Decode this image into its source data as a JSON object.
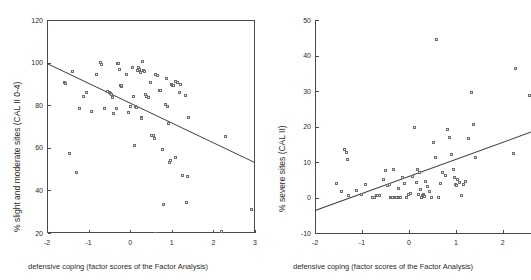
{
  "figure": {
    "panels": [
      "left",
      "right"
    ],
    "marker_color": "#6e6e6e",
    "line_color": "#3a3a3a",
    "axis_color": "#4a4a4a"
  },
  "left": {
    "y_title": "% slight and moderate sites (CAL II 0-4)",
    "x_title": "defensive coping (factor scores of the Factor Analysis)",
    "y_ticks": [
      "20",
      "40",
      "60",
      "80",
      "100",
      "120"
    ],
    "x_ticks": [
      "-2",
      "-1",
      "0",
      "1",
      "2",
      "3"
    ]
  },
  "right": {
    "y_title": "% severe sites (CAL II)",
    "x_title": "defensive coping (factor scores of the Factor Analysis)",
    "y_ticks": [
      "-10",
      "0",
      "10",
      "20",
      "30",
      "40",
      "50"
    ],
    "x_ticks": [
      "-2",
      "-1",
      "0",
      "1",
      "2"
    ]
  },
  "chart_data": [
    {
      "type": "scatter",
      "panel": "left",
      "title": "",
      "xlabel": "defensive coping (factor scores of the Factor Analysis)",
      "ylabel": "% slight and moderate sites (CAL II 0-4)",
      "xlim": [
        -2,
        3
      ],
      "ylim": [
        20,
        120
      ],
      "xticks": [
        -2,
        -1,
        0,
        1,
        2,
        3
      ],
      "yticks": [
        20,
        40,
        60,
        80,
        100,
        120
      ],
      "grid": false,
      "legend": "none",
      "frame": "box",
      "regression_line": {
        "x": [
          -2,
          3
        ],
        "y": [
          100.0,
          53.5
        ]
      },
      "points": [
        [
          -1.58,
          90.8
        ],
        [
          -1.55,
          90.2
        ],
        [
          -1.47,
          57.2
        ],
        [
          -1.38,
          95.8
        ],
        [
          -1.3,
          48.6
        ],
        [
          -1.22,
          78.6
        ],
        [
          -1.12,
          84.3
        ],
        [
          -1.05,
          86.0
        ],
        [
          -0.92,
          77.0
        ],
        [
          -0.8,
          94.6
        ],
        [
          -0.72,
          100.2
        ],
        [
          -0.7,
          99.2
        ],
        [
          -0.62,
          78.3
        ],
        [
          -0.55,
          86.6
        ],
        [
          -0.5,
          85.8
        ],
        [
          -0.47,
          85.4
        ],
        [
          -0.44,
          85.0
        ],
        [
          -0.42,
          83.8
        ],
        [
          -0.4,
          76.0
        ],
        [
          -0.33,
          78.5
        ],
        [
          -0.3,
          99.8
        ],
        [
          -0.28,
          99.6
        ],
        [
          -0.26,
          96.8
        ],
        [
          -0.24,
          89.4
        ],
        [
          -0.22,
          88.9
        ],
        [
          -0.2,
          89.2
        ],
        [
          -0.1,
          94.6
        ],
        [
          -0.05,
          76.5
        ],
        [
          0.0,
          79.2
        ],
        [
          0.05,
          97.8
        ],
        [
          0.08,
          84.0
        ],
        [
          0.1,
          61.2
        ],
        [
          0.12,
          79.3
        ],
        [
          0.15,
          79.0
        ],
        [
          0.18,
          96.2
        ],
        [
          0.2,
          97.5
        ],
        [
          0.22,
          96.6
        ],
        [
          0.24,
          95.2
        ],
        [
          0.26,
          74.0
        ],
        [
          0.28,
          73.8
        ],
        [
          0.3,
          100.5
        ],
        [
          0.32,
          96.4
        ],
        [
          0.34,
          96.0
        ],
        [
          0.36,
          85.2
        ],
        [
          0.4,
          84.0
        ],
        [
          0.44,
          83.8
        ],
        [
          0.48,
          90.8
        ],
        [
          0.52,
          66.0
        ],
        [
          0.55,
          65.6
        ],
        [
          0.58,
          64.2
        ],
        [
          0.6,
          19.8
        ],
        [
          0.62,
          94.2
        ],
        [
          0.66,
          93.8
        ],
        [
          0.7,
          87.0
        ],
        [
          0.74,
          86.8
        ],
        [
          0.78,
          59.2
        ],
        [
          0.8,
          33.4
        ],
        [
          0.84,
          80.2
        ],
        [
          0.88,
          92.4
        ],
        [
          0.9,
          79.4
        ],
        [
          0.92,
          71.2
        ],
        [
          0.95,
          53.2
        ],
        [
          0.98,
          54.0
        ],
        [
          1.0,
          89.6
        ],
        [
          1.02,
          89.2
        ],
        [
          1.05,
          89.4
        ],
        [
          1.08,
          91.2
        ],
        [
          1.1,
          55.4
        ],
        [
          1.14,
          90.6
        ],
        [
          1.18,
          85.8
        ],
        [
          1.22,
          89.8
        ],
        [
          1.26,
          46.8
        ],
        [
          1.34,
          84.6
        ],
        [
          1.36,
          34.2
        ],
        [
          1.38,
          46.6
        ],
        [
          1.4,
          74.0
        ],
        [
          2.2,
          20.6
        ],
        [
          2.28,
          65.2
        ],
        [
          2.92,
          31.0
        ]
      ]
    },
    {
      "type": "scatter",
      "panel": "right",
      "title": "",
      "xlabel": "defensive coping (factor scores of the Factor Analysis)",
      "ylabel": "% severe sites (CAL II)",
      "xlim": [
        -2,
        2.6
      ],
      "ylim": [
        -10,
        50
      ],
      "xticks": [
        -2,
        -1,
        0,
        1,
        2
      ],
      "yticks": [
        -10,
        0,
        10,
        20,
        30,
        40,
        50
      ],
      "grid": false,
      "legend": "none",
      "frame": "left-bottom",
      "regression_line": {
        "x": [
          -2,
          2.6
        ],
        "y": [
          -3.5,
          18.6
        ]
      },
      "points": [
        [
          -1.55,
          4.0
        ],
        [
          -1.44,
          1.8
        ],
        [
          -1.38,
          13.4
        ],
        [
          -1.33,
          12.7
        ],
        [
          -1.3,
          10.8
        ],
        [
          -1.28,
          0.6
        ],
        [
          -1.12,
          2.0
        ],
        [
          -1.02,
          0.8
        ],
        [
          -0.92,
          3.6
        ],
        [
          -0.78,
          0.0
        ],
        [
          -0.74,
          -0.1
        ],
        [
          -0.7,
          0.7
        ],
        [
          -0.66,
          0.6
        ],
        [
          -0.62,
          0.6
        ],
        [
          -0.55,
          5.0
        ],
        [
          -0.5,
          7.7
        ],
        [
          -0.46,
          3.4
        ],
        [
          -0.42,
          3.6
        ],
        [
          -0.4,
          0.0
        ],
        [
          -0.38,
          0.0
        ],
        [
          -0.34,
          0.0
        ],
        [
          -0.32,
          8.0
        ],
        [
          -0.3,
          0.0
        ],
        [
          -0.28,
          0.0
        ],
        [
          -0.26,
          0.0
        ],
        [
          -0.22,
          2.4
        ],
        [
          -0.2,
          0.0
        ],
        [
          -0.18,
          0.0
        ],
        [
          -0.14,
          5.6
        ],
        [
          -0.1,
          4.0
        ],
        [
          -0.06,
          0.0
        ],
        [
          0.0,
          0.8
        ],
        [
          0.04,
          1.0
        ],
        [
          0.08,
          6.0
        ],
        [
          0.12,
          19.6
        ],
        [
          0.16,
          4.2
        ],
        [
          0.18,
          7.8
        ],
        [
          0.2,
          0.8
        ],
        [
          0.22,
          7.0
        ],
        [
          0.24,
          2.2
        ],
        [
          0.26,
          0.0
        ],
        [
          0.28,
          0.6
        ],
        [
          0.3,
          0.8
        ],
        [
          0.32,
          0.6
        ],
        [
          0.34,
          0.4
        ],
        [
          0.36,
          4.6
        ],
        [
          0.4,
          3.2
        ],
        [
          0.44,
          1.8
        ],
        [
          0.48,
          0.0
        ],
        [
          0.52,
          15.6
        ],
        [
          0.56,
          11.4
        ],
        [
          0.58,
          44.6
        ],
        [
          0.62,
          0.0
        ],
        [
          0.68,
          4.0
        ],
        [
          0.72,
          7.0
        ],
        [
          0.78,
          6.2
        ],
        [
          0.82,
          19.2
        ],
        [
          0.86,
          16.8
        ],
        [
          0.9,
          12.0
        ],
        [
          0.94,
          7.8
        ],
        [
          0.98,
          5.6
        ],
        [
          1.0,
          3.6
        ],
        [
          1.02,
          3.4
        ],
        [
          1.04,
          5.0
        ],
        [
          1.08,
          4.2
        ],
        [
          1.12,
          0.6
        ],
        [
          1.16,
          3.6
        ],
        [
          1.2,
          4.4
        ],
        [
          1.26,
          16.6
        ],
        [
          1.34,
          29.6
        ],
        [
          1.38,
          20.6
        ],
        [
          1.42,
          11.2
        ],
        [
          2.22,
          12.4
        ],
        [
          2.26,
          36.4
        ],
        [
          2.56,
          28.6
        ]
      ]
    }
  ]
}
